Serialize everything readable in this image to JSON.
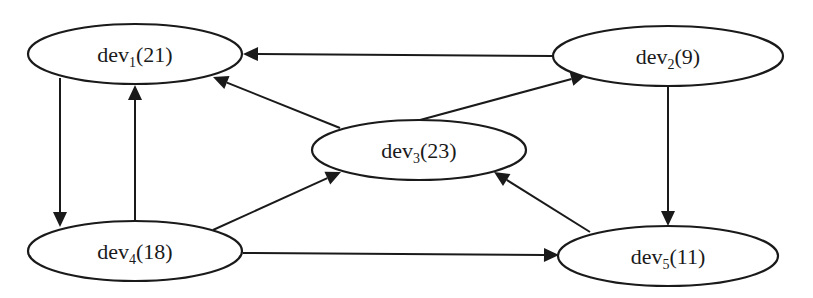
{
  "diagram": {
    "type": "directed-graph",
    "nodes": [
      {
        "id": "dev1",
        "name": "dev",
        "sub": "1",
        "value": "(21)",
        "label": "dev1(21)",
        "cx": 135,
        "cy": 54,
        "rx": 107,
        "ry": 30
      },
      {
        "id": "dev2",
        "name": "dev",
        "sub": "2",
        "value": "(9)",
        "label": "dev2(9)",
        "cx": 668,
        "cy": 56,
        "rx": 115,
        "ry": 30
      },
      {
        "id": "dev3",
        "name": "dev",
        "sub": "3",
        "value": "(23)",
        "label": "dev3(23)",
        "cx": 419,
        "cy": 150,
        "rx": 107,
        "ry": 30
      },
      {
        "id": "dev4",
        "name": "dev",
        "sub": "4",
        "value": "(18)",
        "label": "dev4(18)",
        "cx": 135,
        "cy": 251,
        "rx": 107,
        "ry": 30
      },
      {
        "id": "dev5",
        "name": "dev",
        "sub": "5",
        "value": "(11)",
        "label": "dev5(11)",
        "cx": 668,
        "cy": 256,
        "rx": 110,
        "ry": 30
      }
    ],
    "edges": [
      {
        "from": "dev2",
        "to": "dev1",
        "x1": 553,
        "y1": 56,
        "x2": 243,
        "y2": 54
      },
      {
        "from": "dev3",
        "to": "dev1",
        "x1": 340,
        "y1": 128,
        "x2": 213,
        "y2": 77
      },
      {
        "from": "dev3",
        "to": "dev2",
        "x1": 420,
        "y1": 120,
        "x2": 586,
        "y2": 75
      },
      {
        "from": "dev1",
        "to": "dev4",
        "x1": 60,
        "y1": 78,
        "x2": 60,
        "y2": 227
      },
      {
        "from": "dev4",
        "to": "dev1",
        "x1": 135,
        "y1": 221,
        "x2": 135,
        "y2": 85
      },
      {
        "from": "dev4",
        "to": "dev3",
        "x1": 213,
        "y1": 230,
        "x2": 341,
        "y2": 172
      },
      {
        "from": "dev4",
        "to": "dev5",
        "x1": 243,
        "y1": 253,
        "x2": 559,
        "y2": 255
      },
      {
        "from": "dev5",
        "to": "dev3",
        "x1": 590,
        "y1": 232,
        "x2": 494,
        "y2": 172
      },
      {
        "from": "dev2",
        "to": "dev5",
        "x1": 668,
        "y1": 86,
        "x2": 668,
        "y2": 226
      }
    ]
  }
}
